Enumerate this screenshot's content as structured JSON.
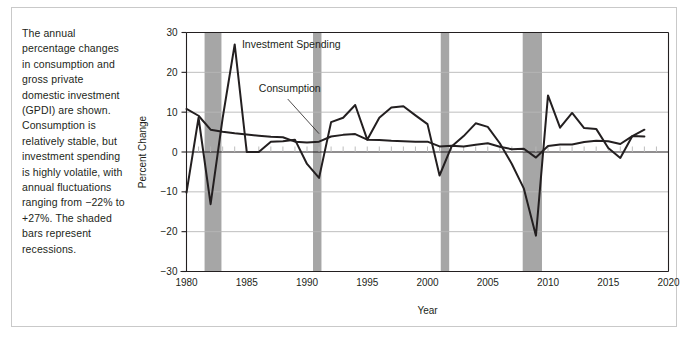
{
  "caption": {
    "text": "The annual percentage changes in consumption and gross private domestic investment (GPDI) are shown. Consumption is relatively stable, but investment spending is highly volatile, with annual fluctuations ranging from −22% to +27%. The shaded bars represent recessions."
  },
  "colors": {
    "line": "#231f20",
    "grid": "#b7b7b7",
    "axis": "#231f20",
    "recession_band": "#a6a6a6",
    "frame": "#c9c9c9",
    "background": "#ffffff",
    "text": "#231f20"
  },
  "chart_data": {
    "type": "line",
    "title": "",
    "xlabel": "Year",
    "ylabel": "Percent Change",
    "xlim": [
      1980,
      2020
    ],
    "ylim": [
      -30,
      30
    ],
    "xticks": [
      1980,
      1985,
      1990,
      1995,
      2000,
      2005,
      2010,
      2015,
      2020
    ],
    "xtick_labels": [
      "1980",
      "1985",
      "1990",
      "1995",
      "2000",
      "2005",
      "2010",
      "2015",
      "2020"
    ],
    "yticks": [
      -30,
      -20,
      -10,
      0,
      10,
      20,
      30
    ],
    "ytick_labels": [
      "−30",
      "−20",
      "−10",
      "0",
      "10",
      "20",
      "30"
    ],
    "grid": true,
    "minor_xtick_interval": 1,
    "legend": "annotations",
    "annotations": [
      {
        "name": "investment-spending-label",
        "text": "Investment Spending",
        "x": 1984.6,
        "y": 26.2
      },
      {
        "name": "consumption-label",
        "text": "Consumption",
        "x": 1986.0,
        "y": 15.0,
        "leader": {
          "x1": 1988.4,
          "y1": 13.3,
          "x2": 1991.0,
          "y2": 4.6
        }
      }
    ],
    "recessions": [
      {
        "name": "recession-1981-1982",
        "start": 1981.5,
        "end": 1982.9
      },
      {
        "name": "recession-1990-1991",
        "start": 1990.5,
        "end": 1991.2
      },
      {
        "name": "recession-2001",
        "start": 2001.1,
        "end": 2001.8
      },
      {
        "name": "recession-2007-2009",
        "start": 2007.9,
        "end": 2009.5
      }
    ],
    "x": [
      1980,
      1981,
      1982,
      1983,
      1984,
      1985,
      1986,
      1987,
      1988,
      1989,
      1990,
      1991,
      1992,
      1993,
      1994,
      1995,
      1996,
      1997,
      1998,
      1999,
      2000,
      2001,
      2002,
      2003,
      2004,
      2005,
      2006,
      2007,
      2008,
      2009,
      2010,
      2011,
      2012,
      2013,
      2014,
      2015,
      2016,
      2017,
      2018
    ],
    "series": [
      {
        "name": "Investment Spending",
        "values": [
          -10.2,
          8.6,
          -13.1,
          8.5,
          27.0,
          0.0,
          0.0,
          2.6,
          2.7,
          3.1,
          -3.0,
          -6.5,
          7.5,
          8.6,
          11.8,
          3.1,
          8.6,
          11.2,
          11.5,
          9.2,
          7.0,
          -5.9,
          1.4,
          4.0,
          7.2,
          6.3,
          2.2,
          -3.0,
          -9.2,
          -21.0,
          14.2,
          6.1,
          9.8,
          6.0,
          5.8,
          1.0,
          -1.5,
          4.0,
          5.6
        ]
      },
      {
        "name": "Consumption",
        "values": [
          10.8,
          9.1,
          5.6,
          5.1,
          4.7,
          4.4,
          4.1,
          3.8,
          3.7,
          2.6,
          2.4,
          2.6,
          3.9,
          4.3,
          4.5,
          3.1,
          3.0,
          2.8,
          2.7,
          2.6,
          2.6,
          1.4,
          1.6,
          1.4,
          1.8,
          2.2,
          1.3,
          0.7,
          0.8,
          -1.4,
          1.5,
          1.9,
          1.9,
          2.5,
          2.8,
          2.7,
          2.0,
          4.0,
          3.9
        ]
      }
    ]
  }
}
